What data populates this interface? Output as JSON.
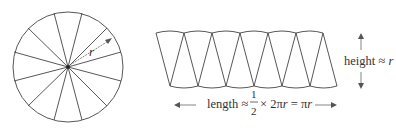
{
  "figure": {
    "circle": {
      "sectors": 12,
      "radius_label": "r"
    },
    "rearranged": {
      "pieces": 12,
      "height_label": "height",
      "height_eq": " ≈ ",
      "height_value": "r",
      "length_label": "length",
      "length_eq": " ≈ ",
      "frac_num": "1",
      "frac_den": "2",
      "times": "× 2π",
      "r1": "r",
      "eq2": " = π",
      "r2": "r"
    }
  }
}
